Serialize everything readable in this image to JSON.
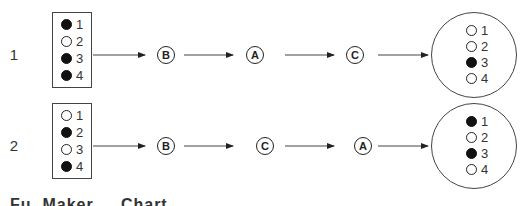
{
  "rows": [
    {
      "label": "1",
      "input": {
        "pins": [
          {
            "num": "1",
            "state": "filled"
          },
          {
            "num": "2",
            "state": "empty"
          },
          {
            "num": "3",
            "state": "filled"
          },
          {
            "num": "4",
            "state": "filled"
          }
        ]
      },
      "steps": [
        "B",
        "A",
        "C"
      ],
      "output": {
        "pins": [
          {
            "num": "1",
            "state": "empty"
          },
          {
            "num": "2",
            "state": "empty"
          },
          {
            "num": "3",
            "state": "filled"
          },
          {
            "num": "4",
            "state": "empty"
          }
        ]
      }
    },
    {
      "label": "2",
      "input": {
        "pins": [
          {
            "num": "1",
            "state": "empty"
          },
          {
            "num": "2",
            "state": "filled"
          },
          {
            "num": "3",
            "state": "empty"
          },
          {
            "num": "4",
            "state": "filled"
          }
        ]
      },
      "steps": [
        "B",
        "C",
        "A"
      ],
      "output": {
        "pins": [
          {
            "num": "1",
            "state": "filled"
          },
          {
            "num": "2",
            "state": "empty"
          },
          {
            "num": "3",
            "state": "filled"
          },
          {
            "num": "4",
            "state": "empty"
          }
        ]
      }
    }
  ],
  "caption": "Fu. Maker ... Chart",
  "colors": {
    "line": "#444444",
    "filled_dot": "#111111",
    "text": "#333333"
  }
}
